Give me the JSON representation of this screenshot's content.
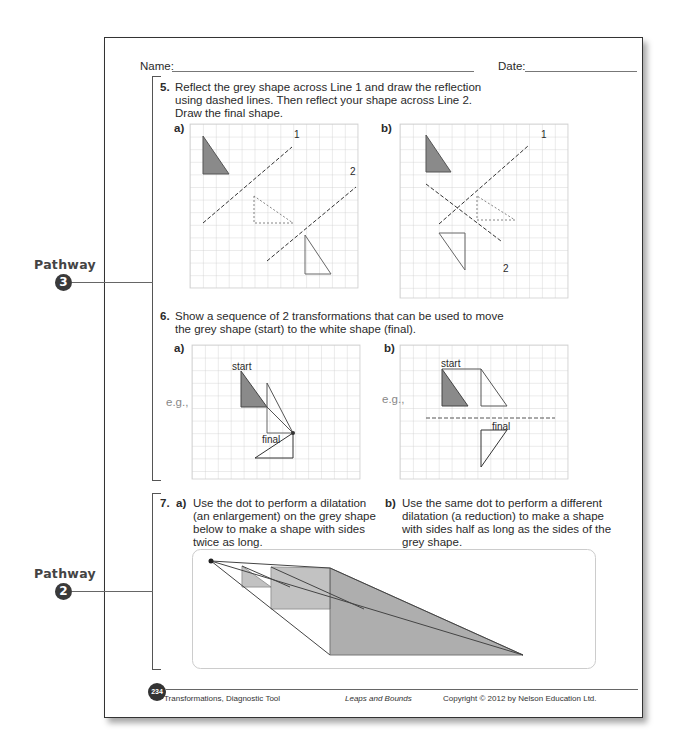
{
  "header": {
    "name_label": "Name:",
    "date_label": "Date:"
  },
  "pathways": [
    {
      "label": "Pathway",
      "number": "3"
    },
    {
      "label": "Pathway",
      "number": "2"
    }
  ],
  "q5": {
    "number": "5.",
    "text_lines": [
      "Reflect the grey shape across Line 1 and draw the reflection",
      "using dashed lines. Then reflect your shape across Line 2.",
      "Draw the final shape."
    ],
    "part_a": {
      "label": "a)",
      "line1_label": "1",
      "line2_label": "2"
    },
    "part_b": {
      "label": "b)",
      "line1_label": "1",
      "line2_label": "2"
    }
  },
  "q6": {
    "number": "6.",
    "text_lines": [
      "Show a sequence of 2 transformations that can be used to move",
      "the grey shape (start) to the white shape (final)."
    ],
    "part_a": {
      "label": "a)",
      "eg": "e.g.,",
      "start_label": "start",
      "final_label": "final"
    },
    "part_b": {
      "label": "b)",
      "eg": "e.g.,",
      "start_label": "start",
      "final_label": "final"
    }
  },
  "q7": {
    "number": "7.",
    "part_a": {
      "label": "a)",
      "text_lines": [
        "Use the dot to perform a dilatation",
        "(an enlargement) on the grey shape",
        "below to make a shape with sides",
        "twice as long."
      ]
    },
    "part_b": {
      "label": "b)",
      "text_lines": [
        "Use the same dot to perform a different",
        "dilatation (a reduction) to make a shape",
        "with sides half as long as the sides of the",
        "grey shape."
      ]
    }
  },
  "footer": {
    "page_number": "234",
    "left": "Transformations, Diagnostic Tool",
    "center": "Leaps and Bounds",
    "right": "Copyright © 2012 by Nelson Education Ltd."
  },
  "colors": {
    "grey_fill": "#8a8a8a",
    "grid": "#c8c8c8",
    "line": "#555555"
  }
}
